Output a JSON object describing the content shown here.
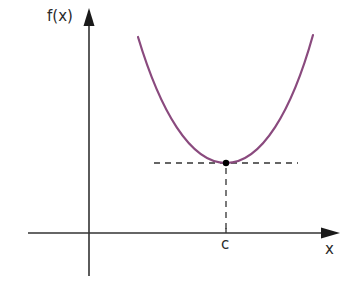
{
  "diagram": {
    "type": "function-graph",
    "axes": {
      "y_label": "f(x)",
      "x_label": "x"
    },
    "annotations": {
      "minimum_x_label": "c"
    },
    "curve": {
      "shape": "upward-opening parabola (U-shaped)",
      "color": "#8a4a7e"
    },
    "point": {
      "description": "minimum point at (c, f(c))",
      "color": "#000000"
    },
    "guides": {
      "horizontal_tangent": "dashed horizontal line through the minimum",
      "vertical_drop": "dashed vertical line from minimum down to x-axis at c"
    },
    "colors": {
      "axis": "#333333",
      "curve": "#8a4a7e",
      "dashes": "#333333",
      "background": "#ffffff"
    }
  }
}
